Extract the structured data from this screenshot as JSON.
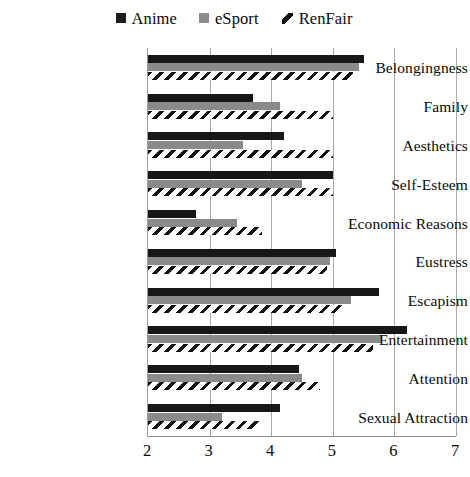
{
  "legend": {
    "position": "top-center",
    "items": [
      {
        "label": "Anime",
        "marker": "filled-square",
        "color": "#171717"
      },
      {
        "label": "eSport",
        "marker": "filled-square",
        "color": "#8a8a8a"
      },
      {
        "label": "RenFair",
        "marker": "diagonal-hatch",
        "color": "#111111"
      }
    ]
  },
  "axis": {
    "x_ticks": [
      "2",
      "3",
      "4",
      "5",
      "6",
      "7"
    ],
    "xlim": [
      2,
      7
    ]
  },
  "chart_data": {
    "type": "bar",
    "orientation": "horizontal",
    "title": "",
    "xlabel": "",
    "ylabel": "",
    "xlim": [
      2,
      7
    ],
    "grid": true,
    "legend_position": "top-center",
    "categories": [
      "Belongingness",
      "Family",
      "Aesthetics",
      "Self-Esteem",
      "Economic Reasons",
      "Eustress",
      "Escapism",
      "Entertainment",
      "Attention",
      "Sexual Attraction"
    ],
    "series": [
      {
        "name": "Anime",
        "color": "#171717",
        "values": [
          5.5,
          3.7,
          4.2,
          5.0,
          2.78,
          5.05,
          5.75,
          6.2,
          4.45,
          4.15
        ]
      },
      {
        "name": "eSport",
        "color": "#8a8a8a",
        "values": [
          5.43,
          4.15,
          3.55,
          4.5,
          3.45,
          4.95,
          5.3,
          5.8,
          4.5,
          3.2
        ]
      },
      {
        "name": "RenFair",
        "color": "#111111",
        "values": [
          5.33,
          5.0,
          5.0,
          5.0,
          3.85,
          4.9,
          5.15,
          5.65,
          4.8,
          3.8
        ]
      }
    ]
  }
}
